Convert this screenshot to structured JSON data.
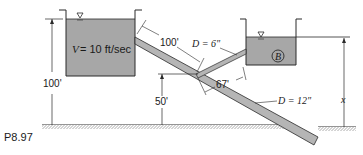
{
  "figure": {
    "label": "P8.97"
  },
  "tank_a": {
    "velocity_label": "V = 10 ft/sec",
    "elevation_label": "100'"
  },
  "tank_b": {
    "name": "B",
    "elevation_label": "x"
  },
  "pipes": {
    "upper_segment_length": "100'",
    "branch_diameter": "D = 6\"",
    "branch_length": "67'",
    "main_diameter": "D = 12\""
  },
  "junction": {
    "elevation_label": "50'"
  },
  "colors": {
    "water": "#a7a7a7",
    "pipe": "#b5b5b5",
    "line": "#2a2a2a",
    "ground_hatch": "#555555"
  }
}
